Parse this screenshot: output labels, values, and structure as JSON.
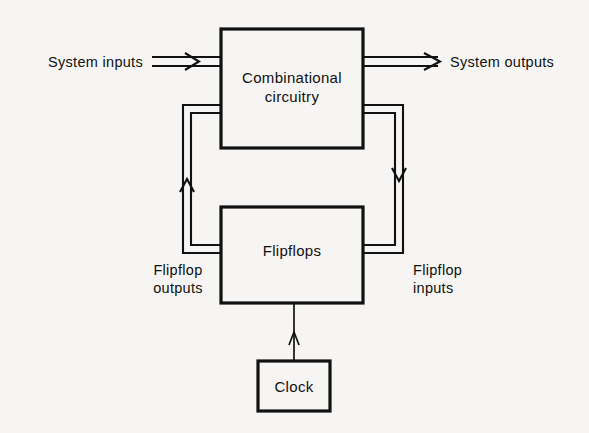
{
  "figure": {
    "kind": "block-diagram",
    "background_color": "#f6f5f3",
    "line_color": "#111111"
  },
  "blocks": [
    {
      "id": "combinational",
      "name": "combinational-circuitry-block",
      "line1": "Combinational",
      "line2": "circuitry",
      "x": 221,
      "y": 29,
      "width": 142,
      "height": 119
    },
    {
      "id": "flipflops",
      "name": "flipflops-block",
      "line1": "Flipflops",
      "line2": "",
      "x": 221,
      "y": 207,
      "width": 142,
      "height": 96
    },
    {
      "id": "clock",
      "name": "clock-block",
      "line1": "Clock",
      "line2": "",
      "x": 258,
      "y": 361,
      "width": 72,
      "height": 50
    }
  ],
  "labels": {
    "system_inputs": "System inputs",
    "system_outputs": "System outputs",
    "flipflop_outputs_line1": "Flipflop",
    "flipflop_outputs_line2": "outputs",
    "flipflop_inputs_line1": "Flipflop",
    "flipflop_inputs_line2": "inputs"
  },
  "connections": [
    {
      "id": "system-inputs-arrow",
      "from": "external",
      "to": "combinational",
      "style": "bus-double-line",
      "direction": "right"
    },
    {
      "id": "system-outputs-arrow",
      "from": "combinational",
      "to": "external",
      "style": "bus-double-line",
      "direction": "right"
    },
    {
      "id": "flipflop-outputs-feedback",
      "from": "flipflops",
      "to": "combinational",
      "style": "bus-double-line",
      "direction": "up"
    },
    {
      "id": "flipflop-inputs-feedback",
      "from": "combinational",
      "to": "flipflops",
      "style": "bus-double-line",
      "direction": "down"
    },
    {
      "id": "clock-connection",
      "from": "clock",
      "to": "flipflops",
      "style": "single-line",
      "direction": "up"
    }
  ]
}
